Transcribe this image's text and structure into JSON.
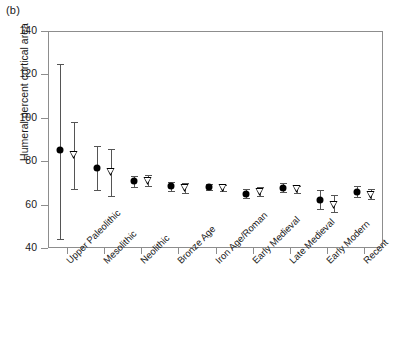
{
  "panel": {
    "label": "(b)"
  },
  "chart_data": {
    "type": "scatter",
    "title": "",
    "xlabel": "",
    "ylabel": "Humeral percent cortical area",
    "ylim": [
      40,
      140
    ],
    "yticks": [
      40,
      60,
      80,
      100,
      120,
      140
    ],
    "ytick_labels": [
      "40",
      "60",
      "80",
      "100",
      "120",
      "140"
    ],
    "grid": false,
    "legend": "none",
    "categories": [
      "Upper Paleolithic",
      "Mesolithic",
      "Neolithic",
      "Bronze Age",
      "Iron Age/Roman",
      "Early Medieval",
      "Late Medieval",
      "Early Modern",
      "Recent"
    ],
    "series": [
      {
        "name": "filled-circle",
        "marker": "filled-circle",
        "values": [
          85.0,
          77.0,
          70.8,
          68.4,
          68.0,
          65.0,
          67.8,
          62.2,
          66.0
        ],
        "err_low": [
          44.0,
          66.5,
          68.2,
          66.2,
          66.8,
          63.0,
          65.8,
          57.8,
          63.5
        ],
        "err_high": [
          125.0,
          87.0,
          73.4,
          70.6,
          69.4,
          67.2,
          69.8,
          66.6,
          68.8
        ]
      },
      {
        "name": "open-triangle",
        "marker": "open-triangle",
        "values": [
          83.0,
          75.0,
          71.0,
          67.5,
          67.8,
          65.8,
          67.0,
          60.0,
          64.5
        ],
        "err_low": [
          67.0,
          63.8,
          68.6,
          65.4,
          66.4,
          63.8,
          65.4,
          56.8,
          62.6
        ],
        "err_high": [
          98.0,
          85.5,
          73.6,
          69.8,
          69.2,
          68.0,
          68.8,
          64.2,
          67.0
        ]
      }
    ]
  }
}
